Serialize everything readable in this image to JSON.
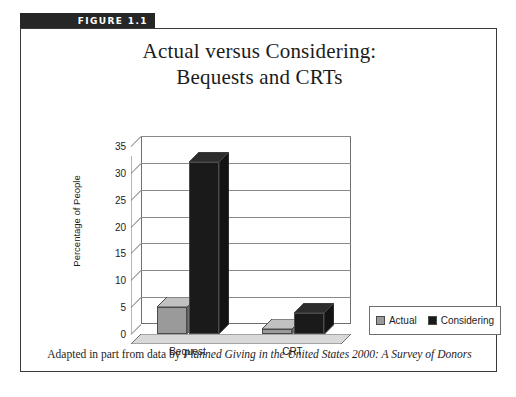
{
  "figure": {
    "tab_label": "FIGURE 1.1",
    "tab_color": "#262626",
    "caption_prefix": "Adapted in part from data by ",
    "caption_italic": "Planned Giving in the United States 2000: A Survey of  Donors"
  },
  "chart_data": {
    "type": "bar",
    "title": "Actual versus Considering:",
    "title_line2": "Bequests and CRTs",
    "subtitle": "",
    "xlabel": "",
    "ylabel": "Percentage of People",
    "categories": [
      "Bequest",
      "CRT"
    ],
    "series": [
      {
        "name": "Actual",
        "values": [
          5,
          1
        ],
        "color": "#9a9a9a"
      },
      {
        "name": "Considering",
        "values": [
          32,
          4
        ],
        "color": "#1a1a1a"
      }
    ],
    "ylim": [
      0,
      35
    ],
    "ytick_values": [
      0,
      5,
      10,
      15,
      20,
      25,
      30,
      35
    ],
    "ytick_labels": [
      "0",
      "5",
      "10",
      "15",
      "20",
      "25",
      "30",
      "35"
    ],
    "grid": true,
    "legend_position": "right",
    "style": "3d-column"
  }
}
